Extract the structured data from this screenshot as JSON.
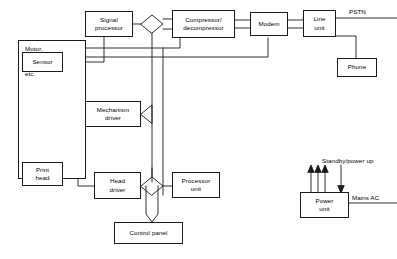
{
  "diagram": {
    "background_color": "#ffffff",
    "line_color": "#1a1a1a",
    "text_color": "#000000",
    "nodes": [
      {
        "id": "peripherals",
        "label": "Motor,\nlamps,\ncutter\netc."
      },
      {
        "id": "sensor",
        "label": "Sensor"
      },
      {
        "id": "print_head",
        "label": "Print\nhead"
      },
      {
        "id": "signal_processor",
        "label": "Signal\nprocessor"
      },
      {
        "id": "mechanism_driver",
        "label": "Mechanism\ndriver"
      },
      {
        "id": "head_driver",
        "label": "Head\ndriver"
      },
      {
        "id": "compressor",
        "label": "Compressor/\ndecompressor"
      },
      {
        "id": "modem",
        "label": "Modem"
      },
      {
        "id": "line_unit",
        "label": "Line\nunit"
      },
      {
        "id": "phone",
        "label": "Phone"
      },
      {
        "id": "processor_unit",
        "label": "Processor\nunit"
      },
      {
        "id": "control_panel",
        "label": "Control panel"
      },
      {
        "id": "power_unit",
        "label": "Power\nunit"
      }
    ],
    "labels": [
      {
        "id": "pstn",
        "text": "PSTN"
      },
      {
        "id": "standby_power_up",
        "text": "Standby/power up"
      },
      {
        "id": "mains_ac",
        "text": "Mains AC"
      }
    ],
    "node_text": {
      "peripherals_l1": "Motor,",
      "peripherals_l2": "lamps,",
      "peripherals_l3": "cutter",
      "peripherals_l4": "etc.",
      "sensor": "Sensor",
      "print_head_l1": "Print",
      "print_head_l2": "head",
      "signal_processor_l1": "Signal",
      "signal_processor_l2": "processor",
      "mechanism_driver_l1": "Mechanism",
      "mechanism_driver_l2": "driver",
      "head_driver_l1": "Head",
      "head_driver_l2": "driver",
      "compressor_l1": "Compressor/",
      "compressor_l2": "decompressor",
      "modem": "Modem",
      "line_unit_l1": "Line",
      "line_unit_l2": "unit",
      "phone": "Phone",
      "processor_unit_l1": "Processor",
      "processor_unit_l2": "unit",
      "control_panel": "Control panel",
      "power_unit_l1": "Power",
      "power_unit_l2": "unit"
    },
    "free_text": {
      "pstn": "PSTN",
      "standby": "Standby/power up",
      "mains_ac": "Mains AC"
    }
  }
}
